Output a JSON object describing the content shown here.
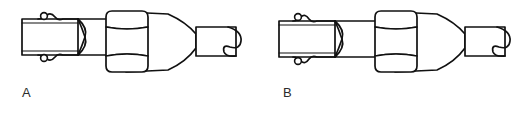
{
  "figure": {
    "background_color": "#ffffff",
    "line_color": "#111111",
    "caption_color": "#2b2b2b",
    "panels": [
      {
        "id": "a",
        "caption": "A",
        "nut_offset": 0
      },
      {
        "id": "b",
        "caption": "B",
        "nut_offset": 8
      }
    ],
    "parts": {
      "shaft": "shaft",
      "nub_upper": "upper-nub",
      "nub_lower": "lower-nub",
      "sleeve": "sleeve",
      "hex_nut": "hex-nut",
      "taper": "conical-taper",
      "tip_body": "tip-body",
      "tip_loop": "tip-loop"
    }
  }
}
